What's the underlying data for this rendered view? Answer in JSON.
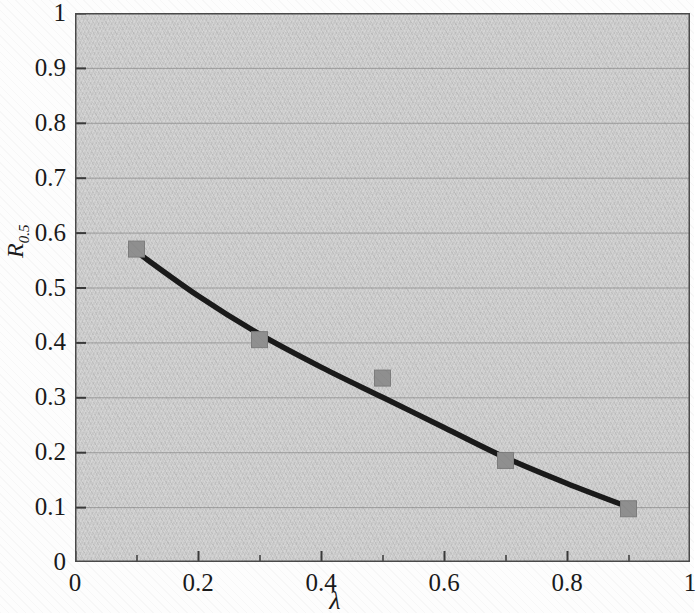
{
  "figure": {
    "background_color": "#fdfdfd",
    "plot_background_color": "#c9c9c9",
    "gridline_color": "#8e8e8e",
    "axis_color": "#3a3a3a",
    "curve_color": "#1a1a1a",
    "marker_color": "#8f8f8f"
  },
  "axes": {
    "y_title_main": "R",
    "y_title_sub": "0.5",
    "x_title": "λ",
    "y_ticks": [
      "0",
      "0.1",
      "0.2",
      "0.3",
      "0.4",
      "0.5",
      "0.6",
      "0.7",
      "0.8",
      "0.9",
      "1"
    ],
    "x_ticks": [
      "0",
      "0.2",
      "0.4",
      "0.6",
      "0.8",
      "1"
    ]
  },
  "chart_data": {
    "type": "scatter",
    "title": "",
    "subtitle": "",
    "xlabel": "λ",
    "ylabel": "R_0.5",
    "xlim": [
      0,
      1
    ],
    "ylim": [
      0,
      1
    ],
    "x_tick_values": [
      0,
      0.2,
      0.4,
      0.6,
      0.8,
      1
    ],
    "x_minor_tick_values": [
      0.1,
      0.3,
      0.5,
      0.7,
      0.9
    ],
    "y_tick_values": [
      0,
      0.1,
      0.2,
      0.3,
      0.4,
      0.5,
      0.6,
      0.7,
      0.8,
      0.9,
      1
    ],
    "grid": "horizontal",
    "legend": "none",
    "series": [
      {
        "name": "measured",
        "type": "scatter",
        "marker": "square",
        "marker_color": "#8f8f8f",
        "x": [
          0.1,
          0.3,
          0.5,
          0.7,
          0.9
        ],
        "values": [
          0.57,
          0.405,
          0.335,
          0.185,
          0.097
        ]
      },
      {
        "name": "fitted curve",
        "type": "line",
        "line_color": "#1a1a1a",
        "x": [
          0.1,
          0.2,
          0.3,
          0.4,
          0.5,
          0.6,
          0.7,
          0.8,
          0.9
        ],
        "values": [
          0.565,
          0.485,
          0.415,
          0.355,
          0.3,
          0.245,
          0.19,
          0.143,
          0.1
        ]
      }
    ]
  }
}
